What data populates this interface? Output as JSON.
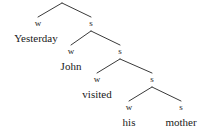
{
  "figure": {
    "kind": "metrical-tree-diagram",
    "sentence": "Yesterday John visited his mother",
    "width": 208,
    "height": 140,
    "background_color": "#ffffff",
    "line_color": "#3a3a3a",
    "text_color": "#1a1a1a",
    "stress_labels": {
      "weak": "w",
      "strong": "s"
    }
  },
  "levels": [
    {
      "index": 0,
      "apex": {
        "x": 62,
        "y": 3
      },
      "weak": {
        "label": "w",
        "x": 38,
        "y": 18,
        "label_y": 19
      },
      "strong": {
        "label": "s",
        "x": 91,
        "y": 18,
        "label_y": 19
      }
    },
    {
      "index": 1,
      "apex": {
        "x": 91,
        "y": 31
      },
      "weak": {
        "label": "w",
        "x": 71,
        "y": 46,
        "label_y": 47
      },
      "strong": {
        "label": "s",
        "x": 120,
        "y": 46,
        "label_y": 47
      }
    },
    {
      "index": 2,
      "apex": {
        "x": 120,
        "y": 59
      },
      "weak": {
        "label": "w",
        "x": 97,
        "y": 74,
        "label_y": 75
      },
      "strong": {
        "label": "s",
        "x": 152,
        "y": 74,
        "label_y": 75
      }
    },
    {
      "index": 3,
      "apex": {
        "x": 152,
        "y": 87
      },
      "weak": {
        "label": "w",
        "x": 129,
        "y": 102,
        "label_y": 103
      },
      "strong": {
        "label": "s",
        "x": 181,
        "y": 102,
        "label_y": 103
      }
    }
  ],
  "words": [
    {
      "text": "Yesterday",
      "x": 36,
      "y": 33
    },
    {
      "text": "John",
      "x": 71,
      "y": 61
    },
    {
      "text": "visited",
      "x": 97,
      "y": 89
    },
    {
      "text": "his",
      "x": 129,
      "y": 117
    },
    {
      "text": "mother",
      "x": 181,
      "y": 117
    }
  ],
  "branches": [
    {
      "from": "level0-apex",
      "to": "level0-weak",
      "x1": 62,
      "y1": 3,
      "x2": 38,
      "y2": 17
    },
    {
      "from": "level0-apex",
      "to": "level0-strong",
      "x1": 62,
      "y1": 3,
      "x2": 91,
      "y2": 17
    },
    {
      "from": "level1-apex",
      "to": "level1-weak",
      "x1": 91,
      "y1": 31,
      "x2": 71,
      "y2": 45
    },
    {
      "from": "level1-apex",
      "to": "level1-strong",
      "x1": 91,
      "y1": 31,
      "x2": 120,
      "y2": 45
    },
    {
      "from": "level2-apex",
      "to": "level2-weak",
      "x1": 120,
      "y1": 59,
      "x2": 97,
      "y2": 73
    },
    {
      "from": "level2-apex",
      "to": "level2-strong",
      "x1": 120,
      "y1": 59,
      "x2": 152,
      "y2": 73
    },
    {
      "from": "level3-apex",
      "to": "level3-weak",
      "x1": 152,
      "y1": 87,
      "x2": 129,
      "y2": 101
    },
    {
      "from": "level3-apex",
      "to": "level3-strong",
      "x1": 152,
      "y1": 87,
      "x2": 181,
      "y2": 101
    }
  ]
}
